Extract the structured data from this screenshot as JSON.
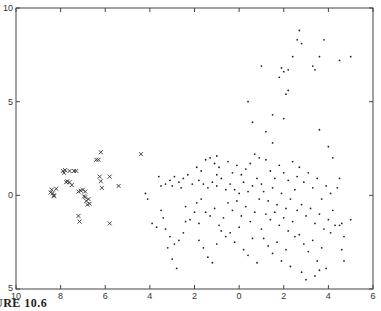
{
  "caption": "URE 10.6",
  "chart_data": {
    "type": "scatter",
    "title": "",
    "xlabel": "",
    "ylabel": "",
    "xlim": [
      -10,
      6
    ],
    "ylim": [
      -5,
      10
    ],
    "grid": false,
    "legend": null,
    "x_ticks": [
      -10,
      -8,
      -6,
      -4,
      -2,
      0,
      2,
      4,
      6
    ],
    "x_tick_labels": [
      "10",
      "8",
      "6",
      "4",
      "2",
      "0",
      "2",
      "4",
      "6"
    ],
    "y_ticks": [
      10,
      5,
      0,
      -5
    ],
    "y_tick_labels": [
      "10",
      "5",
      "0",
      "5"
    ],
    "series": [
      {
        "name": "cluster-x",
        "marker": "x",
        "points": [
          [
            -8.4,
            0.3
          ],
          [
            -8.35,
            0.1
          ],
          [
            -8.3,
            -0.05
          ],
          [
            -8.45,
            0.15
          ],
          [
            -8.2,
            0.35
          ],
          [
            -8.3,
            0.0
          ],
          [
            -7.9,
            1.3
          ],
          [
            -7.85,
            1.2
          ],
          [
            -7.8,
            1.35
          ],
          [
            -7.6,
            1.3
          ],
          [
            -7.4,
            1.3
          ],
          [
            -7.3,
            1.3
          ],
          [
            -7.75,
            0.7
          ],
          [
            -7.7,
            0.75
          ],
          [
            -7.6,
            0.7
          ],
          [
            -7.5,
            0.55
          ],
          [
            -7.2,
            0.2
          ],
          [
            -7.1,
            0.25
          ],
          [
            -7.0,
            0.3
          ],
          [
            -6.9,
            0.2
          ],
          [
            -6.95,
            -0.05
          ],
          [
            -6.9,
            -0.1
          ],
          [
            -6.85,
            -0.3
          ],
          [
            -6.8,
            -0.5
          ],
          [
            -6.7,
            -0.45
          ],
          [
            -6.75,
            -0.2
          ],
          [
            -7.2,
            -1.1
          ],
          [
            -7.15,
            -1.4
          ],
          [
            -6.4,
            1.9
          ],
          [
            -6.3,
            1.9
          ],
          [
            -6.2,
            2.3
          ],
          [
            -6.25,
            1.0
          ],
          [
            -6.2,
            0.75
          ],
          [
            -6.15,
            0.4
          ],
          [
            -5.8,
            1.0
          ],
          [
            -5.4,
            0.5
          ],
          [
            -5.8,
            -1.5
          ],
          [
            -4.4,
            2.2
          ]
        ]
      },
      {
        "name": "cluster-dot",
        "marker": ".",
        "points": [
          [
            -4.2,
            0.1
          ],
          [
            -4.1,
            -0.2
          ],
          [
            -3.9,
            -1.5
          ],
          [
            -3.7,
            -1.7
          ],
          [
            -3.4,
            -1.2
          ],
          [
            -3.0,
            -3.4
          ],
          [
            -2.8,
            -3.9
          ],
          [
            -3.2,
            -2.8
          ],
          [
            -3.6,
            1.0
          ],
          [
            -3.3,
            0.6
          ],
          [
            -3.1,
            0.8
          ],
          [
            -2.9,
            1.0
          ],
          [
            -2.7,
            0.7
          ],
          [
            -2.5,
            0.9
          ],
          [
            -2.3,
            1.1
          ],
          [
            -2.1,
            0.6
          ],
          [
            -3.5,
            0.5
          ],
          [
            -3.0,
            0.5
          ],
          [
            -2.6,
            0.4
          ],
          [
            -2.4,
            -0.6
          ],
          [
            -2.2,
            -1.3
          ],
          [
            -2.0,
            -0.9
          ],
          [
            -1.8,
            -1.5
          ],
          [
            -3.5,
            -0.8
          ],
          [
            -3.3,
            -1.8
          ],
          [
            -3.1,
            -2.2
          ],
          [
            -2.9,
            -2.6
          ],
          [
            -2.7,
            -2.4
          ],
          [
            -2.5,
            -2.0
          ],
          [
            -2.4,
            -1.4
          ],
          [
            -1.9,
            1.5
          ],
          [
            -1.7,
            1.3
          ],
          [
            -1.5,
            1.9
          ],
          [
            -1.3,
            2.0
          ],
          [
            -1.1,
            1.7
          ],
          [
            -0.9,
            1.5
          ],
          [
            -1.0,
            1.1
          ],
          [
            -1.8,
            0.8
          ],
          [
            -1.6,
            0.6
          ],
          [
            -1.4,
            0.4
          ],
          [
            -1.2,
            0.7
          ],
          [
            -1.0,
            0.5
          ],
          [
            -0.8,
            0.9
          ],
          [
            -0.6,
            0.3
          ],
          [
            -1.9,
            -0.4
          ],
          [
            -1.7,
            -0.2
          ],
          [
            -1.5,
            -0.9
          ],
          [
            -1.3,
            -1.1
          ],
          [
            -1.1,
            -0.7
          ],
          [
            -0.9,
            -1.6
          ],
          [
            -0.7,
            -1.2
          ],
          [
            -1.8,
            -2.4
          ],
          [
            -1.6,
            -2.8
          ],
          [
            -1.4,
            -3.3
          ],
          [
            -1.2,
            -3.6
          ],
          [
            -1.0,
            -2.6
          ],
          [
            -0.8,
            -1.9
          ],
          [
            -0.6,
            -2.2
          ],
          [
            -0.5,
            1.8
          ],
          [
            -0.3,
            1.2
          ],
          [
            -0.1,
            1.6
          ],
          [
            0.1,
            1.1
          ],
          [
            0.3,
            1.4
          ],
          [
            0.5,
            1.7
          ],
          [
            0.7,
            2.2
          ],
          [
            0.9,
            2.0
          ],
          [
            -0.4,
            0.6
          ],
          [
            -0.2,
            0.3
          ],
          [
            0.0,
            0.1
          ],
          [
            0.2,
            0.7
          ],
          [
            0.4,
            0.2
          ],
          [
            0.6,
            0.5
          ],
          [
            0.8,
            0.9
          ],
          [
            1.0,
            0.6
          ],
          [
            -0.5,
            -0.4
          ],
          [
            -0.3,
            -0.8
          ],
          [
            -0.1,
            -0.3
          ],
          [
            0.1,
            -1.1
          ],
          [
            0.3,
            -0.6
          ],
          [
            0.5,
            -1.4
          ],
          [
            0.7,
            -0.9
          ],
          [
            0.9,
            -0.2
          ],
          [
            -0.4,
            -2.0
          ],
          [
            -0.2,
            -2.5
          ],
          [
            0.0,
            -1.7
          ],
          [
            0.2,
            -2.9
          ],
          [
            0.4,
            -3.2
          ],
          [
            0.6,
            -2.3
          ],
          [
            0.8,
            -3.6
          ],
          [
            1.0,
            -1.8
          ],
          [
            1.2,
            1.9
          ],
          [
            1.4,
            1.3
          ],
          [
            1.6,
            0.9
          ],
          [
            1.8,
            1.6
          ],
          [
            2.0,
            1.2
          ],
          [
            2.2,
            0.8
          ],
          [
            2.4,
            1.8
          ],
          [
            2.6,
            1.0
          ],
          [
            1.1,
            0.2
          ],
          [
            1.3,
            -0.3
          ],
          [
            1.5,
            0.4
          ],
          [
            1.7,
            -0.5
          ],
          [
            1.9,
            0.1
          ],
          [
            2.1,
            -0.7
          ],
          [
            2.3,
            -0.2
          ],
          [
            2.5,
            0.3
          ],
          [
            1.2,
            -1.0
          ],
          [
            1.4,
            -1.3
          ],
          [
            1.6,
            -0.9
          ],
          [
            1.8,
            -1.6
          ],
          [
            2.0,
            -1.2
          ],
          [
            2.2,
            -1.9
          ],
          [
            2.4,
            -1.4
          ],
          [
            2.6,
            -0.8
          ],
          [
            1.1,
            -2.3
          ],
          [
            1.3,
            -2.7
          ],
          [
            1.5,
            -3.1
          ],
          [
            1.7,
            -2.5
          ],
          [
            1.9,
            -3.5
          ],
          [
            2.1,
            -2.9
          ],
          [
            2.3,
            -3.8
          ],
          [
            2.5,
            -2.2
          ],
          [
            2.7,
            1.5
          ],
          [
            2.9,
            0.7
          ],
          [
            3.1,
            1.2
          ],
          [
            3.3,
            0.4
          ],
          [
            3.5,
            0.9
          ],
          [
            3.7,
            -0.2
          ],
          [
            3.9,
            0.5
          ],
          [
            4.1,
            0.1
          ],
          [
            2.8,
            -0.5
          ],
          [
            3.0,
            -1.1
          ],
          [
            3.2,
            -0.7
          ],
          [
            3.4,
            -1.5
          ],
          [
            3.6,
            -1.0
          ],
          [
            3.8,
            -1.8
          ],
          [
            4.0,
            -1.3
          ],
          [
            4.2,
            -0.8
          ],
          [
            2.7,
            -2.1
          ],
          [
            2.9,
            -2.6
          ],
          [
            3.1,
            -3.0
          ],
          [
            3.3,
            -2.4
          ],
          [
            3.5,
            -3.5
          ],
          [
            3.7,
            -2.8
          ],
          [
            3.9,
            -3.9
          ],
          [
            4.1,
            -2.0
          ],
          [
            2.8,
            -4.1
          ],
          [
            3.0,
            -4.5
          ],
          [
            3.4,
            -4.3
          ],
          [
            3.6,
            -4.0
          ],
          [
            4.3,
            -1.6
          ],
          [
            4.5,
            -1.6
          ],
          [
            4.6,
            -1.5
          ],
          [
            4.7,
            -2.2
          ],
          [
            4.6,
            -2.9
          ],
          [
            4.7,
            -3.5
          ],
          [
            4.4,
            0.4
          ],
          [
            4.2,
            2.0
          ],
          [
            4.0,
            2.6
          ],
          [
            3.6,
            3.5
          ],
          [
            4.5,
            0.9
          ],
          [
            5.0,
            -1.3
          ],
          [
            0.6,
            3.9
          ],
          [
            -1.0,
            2.1
          ],
          [
            1.5,
            4.3
          ],
          [
            2.0,
            4.1
          ],
          [
            2.2,
            5.6
          ],
          [
            2.1,
            5.4
          ],
          [
            2.0,
            6.6
          ],
          [
            2.2,
            6.7
          ],
          [
            1.8,
            6.3
          ],
          [
            1.9,
            6.8
          ],
          [
            2.4,
            7.4
          ],
          [
            2.6,
            8.3
          ],
          [
            2.7,
            8.8
          ],
          [
            2.8,
            8.1
          ],
          [
            3.3,
            6.9
          ],
          [
            3.6,
            7.4
          ],
          [
            3.8,
            8.3
          ],
          [
            3.4,
            6.7
          ],
          [
            4.5,
            7.2
          ],
          [
            5.0,
            7.4
          ],
          [
            1.5,
            2.8
          ],
          [
            1.2,
            3.4
          ],
          [
            0.4,
            5.0
          ],
          [
            1.0,
            6.9
          ]
        ]
      }
    ]
  }
}
